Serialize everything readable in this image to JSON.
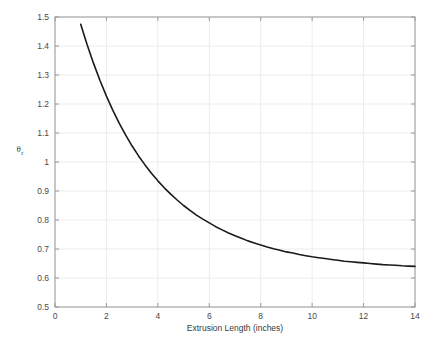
{
  "figure": {
    "background": "#ffffff",
    "plot_area": {
      "left": 55,
      "top": 17,
      "right": 415,
      "bottom": 307
    }
  },
  "chart_data": {
    "type": "line",
    "title": "",
    "subtitle": "",
    "xlabel": "Extrusion Length (inches)",
    "ylabel": "θ",
    "ylabel_subscript": "r",
    "xlim": [
      0,
      14
    ],
    "ylim": [
      0.5,
      1.5
    ],
    "xticks": [
      0,
      2,
      4,
      6,
      8,
      10,
      12,
      14
    ],
    "xticklabels": [
      "0",
      "2",
      "4",
      "6",
      "8",
      "10",
      "12",
      "14"
    ],
    "yticks": [
      0.5,
      0.6,
      0.7,
      0.8,
      0.9,
      1.0,
      1.1,
      1.2,
      1.3,
      1.4,
      1.5
    ],
    "yticklabels": [
      "0.5",
      "0.6",
      "0.7",
      "0.8",
      "0.9",
      "1",
      "1.1",
      "1.2",
      "1.3",
      "1.4",
      "1.5"
    ],
    "grid": true,
    "grid_color": "#ececec",
    "legend": null,
    "legend_position": "none",
    "series": [
      {
        "name": "theta_r",
        "color": "#1a1a1a",
        "linewidth": 1.6,
        "x": [
          1.0,
          1.25,
          1.5,
          1.75,
          2.0,
          2.25,
          2.5,
          2.75,
          3.0,
          3.25,
          3.5,
          3.75,
          4.0,
          4.25,
          4.5,
          4.75,
          5.0,
          5.25,
          5.5,
          5.75,
          6.0,
          6.25,
          6.5,
          6.75,
          7.0,
          7.25,
          7.5,
          7.75,
          8.0,
          8.25,
          8.5,
          8.75,
          9.0,
          9.25,
          9.5,
          9.75,
          10.0,
          10.25,
          10.5,
          10.75,
          11.0,
          11.25,
          11.5,
          11.75,
          12.0,
          12.25,
          12.5,
          12.75,
          13.0,
          13.25,
          13.5,
          13.75,
          14.0
        ],
        "y": [
          1.475,
          1.404,
          1.34,
          1.281,
          1.227,
          1.178,
          1.133,
          1.093,
          1.055,
          1.021,
          0.99,
          0.961,
          0.935,
          0.911,
          0.889,
          0.869,
          0.85,
          0.833,
          0.817,
          0.803,
          0.79,
          0.777,
          0.766,
          0.755,
          0.746,
          0.737,
          0.728,
          0.721,
          0.714,
          0.707,
          0.701,
          0.696,
          0.69,
          0.686,
          0.681,
          0.677,
          0.673,
          0.67,
          0.667,
          0.664,
          0.661,
          0.658,
          0.656,
          0.654,
          0.652,
          0.65,
          0.648,
          0.646,
          0.645,
          0.644,
          0.642,
          0.641,
          0.64
        ]
      }
    ]
  }
}
